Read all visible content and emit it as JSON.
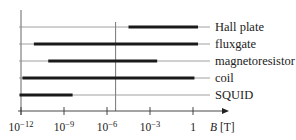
{
  "chart_data": {
    "type": "range-bar",
    "title": "",
    "xlabel": "B [T]",
    "ylabel": "",
    "xscale": "log",
    "xlim_log10": [
      -12,
      1.8
    ],
    "x_ticks": [
      {
        "exp": -12,
        "label": "10",
        "sup": "−12"
      },
      {
        "exp": -9,
        "label": "10",
        "sup": "−9"
      },
      {
        "exp": -6,
        "label": "10",
        "sup": "−6"
      },
      {
        "exp": -3,
        "label": "10",
        "sup": "−3"
      },
      {
        "exp": 0,
        "label": "1",
        "sup": ""
      }
    ],
    "reference_line_log10": -5.4,
    "grid": false,
    "series": [
      {
        "name": "Hall plate",
        "min_log10": -4.5,
        "max_log10": 0.35
      },
      {
        "name": "fluxgate",
        "min_log10": -11.1,
        "max_log10": 0.35
      },
      {
        "name": "magnetoresistor",
        "min_log10": -10.1,
        "max_log10": -2.5
      },
      {
        "name": "coil",
        "min_log10": -11.9,
        "max_log10": 0.1
      },
      {
        "name": "SQUID",
        "min_log10": -12.1,
        "max_log10": -8.4
      }
    ]
  },
  "axis": {
    "x_label_italic": "B",
    "x_label_unit": " [T]"
  }
}
